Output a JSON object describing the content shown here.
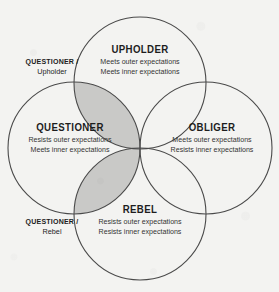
{
  "diagram": {
    "background_color": "#f3f3f1",
    "stroke_color": "#4a4a4a",
    "shaded_color": "#c9c9c7",
    "quadrants": [
      {
        "id": "upholder",
        "title": "UPHOLDER",
        "lines": [
          "Meets outer expectations",
          "Meets inner expectations"
        ]
      },
      {
        "id": "questioner",
        "title": "QUESTIONER",
        "lines": [
          "Resists outer expectations",
          "Meets inner expectations"
        ]
      },
      {
        "id": "obliger",
        "title": "OBLIGER",
        "lines": [
          "Meets outer expectations",
          "Resists inner expectations"
        ]
      },
      {
        "id": "rebel",
        "title": "REBEL",
        "lines": [
          "Resists outer expectations",
          "Resists inner expectations"
        ]
      }
    ],
    "outer_labels": [
      {
        "id": "questioner-upholder",
        "primary": "QUESTIONER /",
        "secondary": "Upholder"
      },
      {
        "id": "questioner-rebel",
        "primary": "QUESTIONER /",
        "secondary": "Rebel"
      }
    ]
  }
}
